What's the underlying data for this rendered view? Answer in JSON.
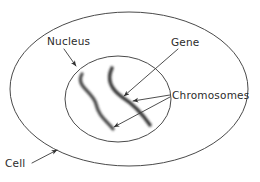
{
  "diagram": {
    "background_color": "#ffffff",
    "ink_color": "#2b2b2b",
    "membrane_color": "#4a4a4a",
    "chromosome_color": "#3d3d3d",
    "labels": {
      "cell": "Cell",
      "nucleus": "Nucleus",
      "gene": "Gene",
      "chromosomes": "Chromosomes"
    },
    "structures": {
      "cell_label_desc": "outer cell body",
      "nucleus_label_desc": "inner nucleus",
      "chromosome_left_desc": "left S-shaped chromosome",
      "chromosome_right_desc": "right S-shaped chromosome",
      "gene_target_desc": "point on right chromosome"
    }
  }
}
